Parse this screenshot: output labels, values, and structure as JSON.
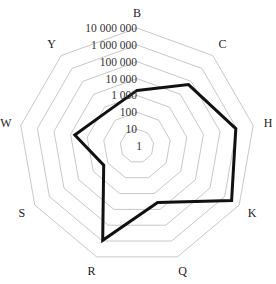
{
  "chart_data": {
    "type": "radar",
    "title": "",
    "scale": "log10",
    "categories": [
      "B",
      "C",
      "H",
      "K",
      "Q",
      "R",
      "S",
      "W",
      "Y"
    ],
    "series": [
      {
        "name": "Series 1",
        "values": [
          2000,
          57000,
          900000,
          3000000,
          3700,
          900000,
          190,
          5600,
          500
        ],
        "color": "#111111"
      }
    ],
    "tick_labels": [
      "1",
      "10",
      "100",
      "1 000",
      "10 000",
      "100 000",
      "1 000 000",
      "10 000 000"
    ],
    "tick_values": [
      1,
      10,
      100,
      1000,
      10000,
      100000,
      1000000,
      10000000
    ],
    "rlim": [
      1,
      10000000
    ],
    "grid": true,
    "grid_color": "#c8c8c8",
    "legend": "none"
  }
}
